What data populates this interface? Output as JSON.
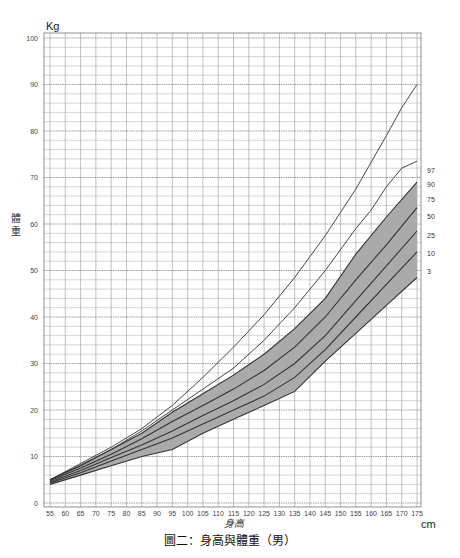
{
  "chart_data": {
    "type": "line",
    "title": "圖二：身高與體重（男）",
    "xlabel": "身高",
    "ylabel": "體重",
    "x_unit": "cm",
    "y_unit": "Kg",
    "xlim": [
      53,
      177
    ],
    "ylim": [
      0,
      100
    ],
    "grid": true,
    "x_ticks": [
      55,
      60,
      65,
      70,
      75,
      80,
      85,
      90,
      95,
      100,
      105,
      110,
      115,
      120,
      125,
      130,
      135,
      140,
      145,
      150,
      155,
      160,
      165,
      170,
      175
    ],
    "y_ticks": [
      0,
      10,
      20,
      30,
      40,
      50,
      60,
      70,
      80,
      90,
      100
    ],
    "legend_position": "right-end labels",
    "shaded_band": {
      "lower": "3",
      "upper": "90",
      "color": "#aaaaaa"
    },
    "series": [
      {
        "name": "97",
        "x": [
          55,
          65,
          75,
          85,
          95,
          105,
          115,
          125,
          135,
          145,
          155,
          165,
          170,
          175
        ],
        "y": [
          5.0,
          8.5,
          12.0,
          16.0,
          21.0,
          27.0,
          33.5,
          40.5,
          48.5,
          57.5,
          67.5,
          79.0,
          85.0,
          90.0
        ]
      },
      {
        "name": "90",
        "x": [
          55,
          65,
          75,
          85,
          95,
          105,
          115,
          125,
          135,
          145,
          155,
          160,
          165,
          170,
          175
        ],
        "y": [
          5.0,
          8.2,
          11.5,
          15.5,
          20.0,
          24.5,
          29.0,
          35.0,
          42.0,
          50.0,
          59.0,
          63.0,
          68.0,
          72.0,
          73.5
        ]
      },
      {
        "name": "75",
        "x": [
          55,
          65,
          75,
          85,
          95,
          105,
          115,
          125,
          135,
          145,
          155,
          165,
          175
        ],
        "y": [
          5.0,
          8.0,
          11.5,
          15.0,
          19.5,
          23.5,
          27.5,
          32.0,
          37.5,
          44.0,
          53.5,
          61.5,
          69.0
        ]
      },
      {
        "name": "50",
        "x": [
          55,
          65,
          75,
          85,
          95,
          105,
          115,
          125,
          135,
          145,
          155,
          165,
          175
        ],
        "y": [
          4.8,
          7.5,
          10.5,
          13.8,
          17.5,
          21.0,
          24.5,
          28.5,
          33.5,
          40.0,
          48.0,
          55.5,
          63.5
        ]
      },
      {
        "name": "25",
        "x": [
          55,
          65,
          75,
          85,
          95,
          105,
          115,
          125,
          135,
          145,
          155,
          165,
          175
        ],
        "y": [
          4.5,
          7.0,
          9.8,
          12.5,
          15.5,
          18.8,
          22.0,
          25.5,
          30.0,
          36.0,
          43.5,
          51.0,
          58.5
        ]
      },
      {
        "name": "10",
        "x": [
          55,
          65,
          75,
          85,
          95,
          105,
          115,
          125,
          135,
          145,
          155,
          165,
          175
        ],
        "y": [
          4.3,
          6.5,
          9.0,
          11.5,
          14.0,
          17.0,
          20.0,
          23.0,
          27.0,
          33.0,
          40.0,
          47.0,
          54.0
        ]
      },
      {
        "name": "3",
        "x": [
          55,
          65,
          75,
          85,
          95,
          105,
          115,
          125,
          135,
          145,
          155,
          165,
          175
        ],
        "y": [
          4.0,
          6.0,
          8.0,
          10.0,
          11.5,
          15.0,
          18.0,
          21.0,
          24.0,
          30.5,
          36.5,
          42.5,
          48.5
        ]
      }
    ]
  }
}
